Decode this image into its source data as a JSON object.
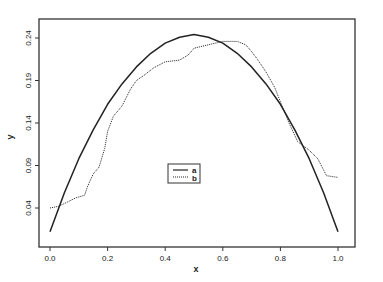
{
  "chart_data": {
    "type": "line",
    "title": "",
    "xlabel": "x",
    "ylabel": "y",
    "xlim": [
      0.0,
      1.0
    ],
    "ylim": [
      0.01,
      0.25
    ],
    "grid": false,
    "legend_position": "center",
    "x_ticks": [
      "0.0",
      "0.2",
      "0.4",
      "0.6",
      "0.8",
      "1.0"
    ],
    "y_ticks": [
      "0.04",
      "0.09",
      "0.14",
      "0.19",
      "0.24"
    ],
    "series": [
      {
        "name": "a",
        "style": "solid",
        "x": [
          0.0,
          0.05,
          0.1,
          0.15,
          0.2,
          0.25,
          0.3,
          0.35,
          0.4,
          0.45,
          0.5,
          0.55,
          0.6,
          0.65,
          0.7,
          0.75,
          0.8,
          0.85,
          0.9,
          0.95,
          1.0
        ],
        "values": [
          0.012,
          0.058,
          0.098,
          0.132,
          0.162,
          0.186,
          0.206,
          0.222,
          0.234,
          0.241,
          0.244,
          0.241,
          0.234,
          0.222,
          0.206,
          0.186,
          0.162,
          0.132,
          0.098,
          0.058,
          0.012
        ]
      },
      {
        "name": "b",
        "style": "dotted",
        "x": [
          0.0,
          0.03,
          0.06,
          0.09,
          0.12,
          0.13,
          0.15,
          0.17,
          0.19,
          0.2,
          0.22,
          0.25,
          0.28,
          0.3,
          0.33,
          0.36,
          0.4,
          0.45,
          0.48,
          0.5,
          0.55,
          0.6,
          0.65,
          0.68,
          0.7,
          0.72,
          0.75,
          0.78,
          0.8,
          0.83,
          0.86,
          0.9,
          0.93,
          0.96,
          1.0
        ],
        "values": [
          0.04,
          0.042,
          0.047,
          0.052,
          0.055,
          0.065,
          0.08,
          0.088,
          0.11,
          0.13,
          0.148,
          0.16,
          0.18,
          0.19,
          0.197,
          0.205,
          0.212,
          0.214,
          0.22,
          0.228,
          0.232,
          0.236,
          0.236,
          0.232,
          0.224,
          0.215,
          0.2,
          0.182,
          0.165,
          0.14,
          0.118,
          0.108,
          0.098,
          0.078,
          0.076
        ]
      }
    ]
  },
  "legend": {
    "items": [
      {
        "label": "a",
        "style": "solid"
      },
      {
        "label": "b",
        "style": "dotted"
      }
    ]
  },
  "colors": {
    "line": "#222222",
    "frame": "#333333"
  }
}
